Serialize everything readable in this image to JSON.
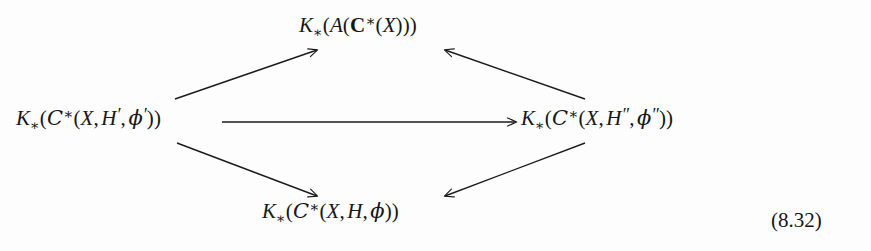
{
  "figure": {
    "kind": "commutative-diagram",
    "shape": "diamond",
    "equation_number": "(8.32)",
    "background_color": "#fdfdfd",
    "ink_color": "#171717"
  },
  "nodes": {
    "top": {
      "id": "node-top",
      "text": "K_*(A(C*(X)))",
      "parts": {
        "K": "K",
        "star_sub": "∗",
        "open1": "(",
        "A": "A",
        "open2": "(",
        "C_bold": "C",
        "star_sup": "∗",
        "open3": "(",
        "X": "X",
        "close": ")))"
      }
    },
    "left": {
      "id": "node-left",
      "text": "K_*(C*(X, H', φ'))",
      "parts": {
        "K": "K",
        "star_sub": "∗",
        "open1": "(",
        "C_script": "C",
        "star_sup": "∗",
        "open2": "(",
        "X": "X",
        "comma1": ",",
        "H": "H",
        "H_prime": "′",
        "comma2": ",",
        "phi": "ϕ",
        "phi_prime": "′",
        "close": "))"
      }
    },
    "right": {
      "id": "node-right",
      "text": "K_*(C*(X, H'', φ''))",
      "parts": {
        "K": "K",
        "star_sub": "∗",
        "open1": "(",
        "C_script": "C",
        "star_sup": "∗",
        "open2": "(",
        "X": "X",
        "comma1": ",",
        "H": "H",
        "H_prime": "″",
        "comma2": ",",
        "phi": "ϕ",
        "phi_prime": "″",
        "close": "))"
      }
    },
    "bottom": {
      "id": "node-bottom",
      "text": "K_*(C*(X, H, φ))",
      "parts": {
        "K": "K",
        "star_sub": "∗",
        "open1": "(",
        "C_script": "C",
        "star_sup": "∗",
        "open2": "(",
        "X": "X",
        "comma1": ",",
        "H": "H",
        "comma2": ",",
        "phi": "ϕ",
        "close": "))"
      }
    }
  },
  "arrows": [
    {
      "name": "left-to-top",
      "from": "left",
      "to": "top",
      "direction": "up-right",
      "label": ""
    },
    {
      "name": "right-to-top",
      "from": "right",
      "to": "top",
      "direction": "up-left",
      "label": ""
    },
    {
      "name": "left-to-right",
      "from": "left",
      "to": "right",
      "direction": "right",
      "label": ""
    },
    {
      "name": "left-to-bottom",
      "from": "left",
      "to": "bottom",
      "direction": "down-right",
      "label": ""
    },
    {
      "name": "right-to-bottom",
      "from": "right",
      "to": "bottom",
      "direction": "down-left",
      "label": ""
    }
  ]
}
